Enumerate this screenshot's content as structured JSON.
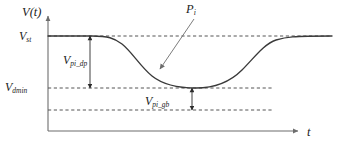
{
  "figure": {
    "kind": "line-plot-schematic",
    "background_color": "#ffffff",
    "curve_color": "#3a3a3a",
    "axis_color": "#6d6d6d",
    "dash_color": "#555555",
    "axes": {
      "y_axis_label": "V(t)",
      "x_axis_label": "t",
      "y_axis_label_parts": {
        "base": "V(t)",
        "sub": ""
      },
      "x_axis_label_parts": {
        "base": "t",
        "sub": ""
      }
    },
    "levels": [
      {
        "name": "v-st",
        "base": "V",
        "sub": "st",
        "label": "V_st",
        "y_px": 36,
        "description": "steady-state supply voltage level"
      },
      {
        "name": "v-dmin",
        "base": "V",
        "sub": "dmin",
        "label": "V_dmin",
        "y_px": 88,
        "description": "minimum allowed droop voltage level"
      },
      {
        "name": "v-lower-guardband",
        "base": "",
        "sub": "",
        "label": "",
        "y_px": 110,
        "description": "lower guardband reference level (unlabeled dashed line)"
      }
    ],
    "dimensions": [
      {
        "name": "v-pi-dp",
        "base": "V",
        "sub": "pi_dp",
        "label": "V_pi_dp",
        "from_y_px": 36,
        "to_y_px": 88,
        "at_x_px": 90,
        "description": "droop magnitude from V_st down to V_dmin"
      },
      {
        "name": "v-pi-gb",
        "base": "V",
        "sub": "pi_gb",
        "label": "V_pi_gb",
        "from_y_px": 88,
        "to_y_px": 110,
        "at_x_px": 192,
        "description": "guardband margin below V_dmin"
      }
    ],
    "annotations": [
      {
        "name": "p-i",
        "base": "P",
        "sub": "i",
        "label": "P_i",
        "text_x_px": 186,
        "text_y_px": 3,
        "leader_from": {
          "x": 193,
          "y": 19
        },
        "leader_to": {
          "x": 158,
          "y": 70
        },
        "description": "callout pointing at the droop waveform"
      }
    ],
    "curve_points": [
      {
        "x": 48,
        "y": 36
      },
      {
        "x": 90,
        "y": 36
      },
      {
        "x": 112,
        "y": 37
      },
      {
        "x": 126,
        "y": 43
      },
      {
        "x": 140,
        "y": 55
      },
      {
        "x": 152,
        "y": 68
      },
      {
        "x": 166,
        "y": 79
      },
      {
        "x": 180,
        "y": 85
      },
      {
        "x": 192,
        "y": 88
      },
      {
        "x": 210,
        "y": 88
      },
      {
        "x": 228,
        "y": 85
      },
      {
        "x": 244,
        "y": 76
      },
      {
        "x": 258,
        "y": 62
      },
      {
        "x": 272,
        "y": 48
      },
      {
        "x": 286,
        "y": 39
      },
      {
        "x": 298,
        "y": 36
      },
      {
        "x": 330,
        "y": 36
      }
    ],
    "geometry": {
      "y_axis_x_px": 48,
      "y_axis_top_px": 14,
      "x_axis_y_px": 131,
      "x_axis_right_px": 300,
      "plot_right_px": 332
    }
  }
}
